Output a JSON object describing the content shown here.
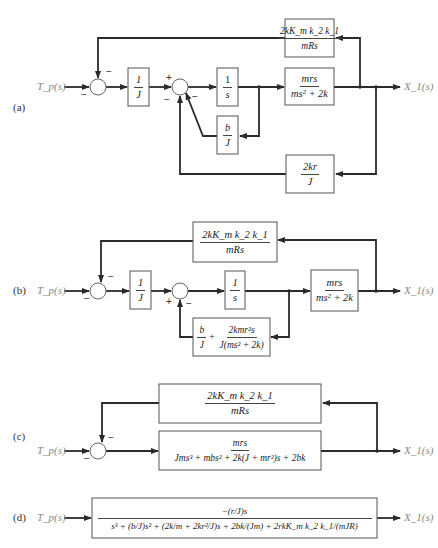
{
  "panels": [
    {
      "id": "a",
      "label": "(a)",
      "input": "T_p(s)",
      "output": "X_1(s)",
      "blocks": {
        "inv_j": {
          "num": "1",
          "den": "J"
        },
        "integrator": {
          "num": "1",
          "den": "s"
        },
        "plant": {
          "num": "mrs",
          "den": "ms² + 2k"
        },
        "motor_fb": {
          "num": "2kK_m k_2 k_1",
          "den": "mRs"
        },
        "damping": {
          "num": "b",
          "den": "J"
        },
        "spring_fb": {
          "num": "2kr",
          "den": "J"
        }
      },
      "signs": {
        "sum1_top": "−",
        "sum1_left": "−",
        "sum2_left": "+",
        "sum2_bottom_left": "−",
        "sum2_bottom_right": "−"
      }
    },
    {
      "id": "b",
      "label": "(b)",
      "input": "T_p(s)",
      "output": "X_1(s)",
      "blocks": {
        "motor_fb": {
          "num": "2kK_m k_2 k_1",
          "den": "mRs"
        },
        "inv_j": {
          "num": "1",
          "den": "J"
        },
        "integrator": {
          "num": "1",
          "den": "s"
        },
        "plant": {
          "num": "mrs",
          "den": "ms² + 2k"
        },
        "combined_fb": {
          "term1_num": "b",
          "term1_den": "J",
          "plus": "+",
          "term2_num": "2kmr²s",
          "term2_den": "J(ms² + 2k)"
        }
      },
      "signs": {
        "sum1_top": "−",
        "sum1_left": "−",
        "sum2_left": "+",
        "sum2_bottom": "−"
      }
    },
    {
      "id": "c",
      "label": "(c)",
      "input": "T_p(s)",
      "output": "X_1(s)",
      "blocks": {
        "motor_fb": {
          "num": "2kK_m k_2 k_1",
          "den": "mRs"
        },
        "forward": {
          "num": "mrs",
          "den": "Jms³ + mbs² + 2k(J + mr²)s + 2bk"
        }
      },
      "signs": {
        "sum_top": "−",
        "sum_left": "−"
      }
    },
    {
      "id": "d",
      "label": "(d)",
      "input": "T_p(s)",
      "output": "X_1(s)",
      "blocks": {
        "closed_loop": {
          "num": "−(r/J)s",
          "den": "s³ + (b/J)s² + (2k/m + 2kr²/J)s + 2bk/(Jm) + 2rkK_m k_2 k_1/(mJR)"
        }
      }
    }
  ]
}
